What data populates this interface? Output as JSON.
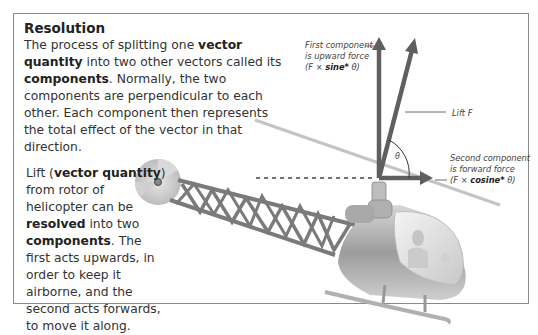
{
  "title": "Resolution",
  "intro": {
    "part1": "The process of splitting one ",
    "bold1": "vector quantity",
    "part2": " into two other vectors called its ",
    "bold2": "components",
    "part3": ". Normally, the two components are perpendicular to each other. Each component then represents the total effect of the vector in that direction."
  },
  "lift_text": {
    "part1": "Lift (",
    "bold1": "vector quantity",
    "part2": ") from rotor of helicopter can be ",
    "bold2": "resolved",
    "part3": " into two ",
    "bold3": "components",
    "part4": ". The first acts upwards, in order to keep it airborne, and the second acts forwards, to move it along."
  },
  "labels": {
    "first_line1": "First component",
    "first_line2": "is upward force",
    "first_f": "(F × ",
    "first_func": "sine*",
    "first_end": " θ)",
    "lift": "Lift F",
    "second_line1": "Second component",
    "second_line2": "is forward force",
    "second_f": "(F × ",
    "second_func": "cosine*",
    "second_end": " θ)",
    "theta": "θ"
  },
  "colors": {
    "arrow": "#5f5f5f",
    "frame": "#8a8a8a",
    "metal": "#9a9a9a"
  }
}
